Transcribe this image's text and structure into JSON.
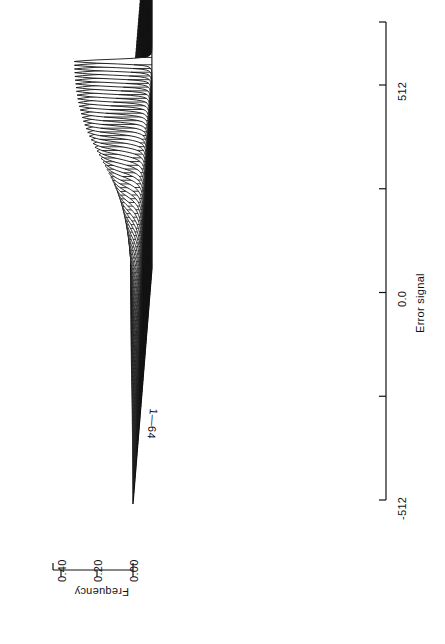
{
  "figure": {
    "orientation": "rotated-90-ccw",
    "background": "#ffffff",
    "ink": "#111111",
    "caption": ""
  },
  "axes": {
    "frequency": {
      "label": "Frequency",
      "ticks": [
        "0.00",
        "0.20",
        "0.40"
      ],
      "tick_values": [
        0.0,
        0.2,
        0.4
      ],
      "range": [
        0.0,
        0.45
      ]
    },
    "error_signal": {
      "label": "Error signal",
      "ticks": [
        "-512",
        "0.0",
        "512"
      ],
      "tick_values": [
        -512,
        0,
        512
      ],
      "range": [
        -512,
        512
      ],
      "minor_tick_count": 5
    },
    "trace": {
      "label": "1—64",
      "range": [
        1,
        64
      ]
    }
  },
  "chart_data": {
    "type": "line",
    "subtype": "ridgeline-waterfall",
    "title": "",
    "xlabel": "Error signal",
    "ylabel": "Frequency",
    "zlabel": "1—64",
    "xlim": [
      -512,
      512
    ],
    "ylim": [
      0.0,
      0.45
    ],
    "grid": false,
    "legend": false,
    "n_series": 64,
    "x": [
      -512,
      -448,
      -384,
      -320,
      -256,
      -192,
      -128,
      -96,
      -64,
      -48,
      -32,
      -24,
      -16,
      -12,
      -8,
      -6,
      -4,
      -3,
      -2,
      -1,
      0,
      1,
      2,
      3,
      4,
      6,
      8,
      12,
      16,
      24,
      32,
      48,
      64,
      96,
      128,
      192,
      256,
      320,
      384,
      448,
      512
    ],
    "series": [
      {
        "name": "1",
        "peak": 0.012,
        "width": 260
      },
      {
        "name": "2",
        "peak": 0.013,
        "width": 252
      },
      {
        "name": "3",
        "peak": 0.014,
        "width": 244
      },
      {
        "name": "4",
        "peak": 0.015,
        "width": 236
      },
      {
        "name": "5",
        "peak": 0.016,
        "width": 228
      },
      {
        "name": "6",
        "peak": 0.018,
        "width": 220
      },
      {
        "name": "7",
        "peak": 0.019,
        "width": 212
      },
      {
        "name": "8",
        "peak": 0.021,
        "width": 204
      },
      {
        "name": "9",
        "peak": 0.023,
        "width": 196
      },
      {
        "name": "10",
        "peak": 0.025,
        "width": 188
      },
      {
        "name": "11",
        "peak": 0.027,
        "width": 180
      },
      {
        "name": "12",
        "peak": 0.03,
        "width": 172
      },
      {
        "name": "13",
        "peak": 0.033,
        "width": 164
      },
      {
        "name": "14",
        "peak": 0.036,
        "width": 156
      },
      {
        "name": "15",
        "peak": 0.039,
        "width": 148
      },
      {
        "name": "16",
        "peak": 0.043,
        "width": 140
      },
      {
        "name": "17",
        "peak": 0.047,
        "width": 132
      },
      {
        "name": "18",
        "peak": 0.052,
        "width": 124
      },
      {
        "name": "19",
        "peak": 0.057,
        "width": 116
      },
      {
        "name": "20",
        "peak": 0.062,
        "width": 109
      },
      {
        "name": "21",
        "peak": 0.068,
        "width": 102
      },
      {
        "name": "22",
        "peak": 0.074,
        "width": 95
      },
      {
        "name": "23",
        "peak": 0.081,
        "width": 88
      },
      {
        "name": "24",
        "peak": 0.088,
        "width": 82
      },
      {
        "name": "25",
        "peak": 0.096,
        "width": 76
      },
      {
        "name": "26",
        "peak": 0.104,
        "width": 70
      },
      {
        "name": "27",
        "peak": 0.113,
        "width": 65
      },
      {
        "name": "28",
        "peak": 0.122,
        "width": 60
      },
      {
        "name": "29",
        "peak": 0.132,
        "width": 55
      },
      {
        "name": "30",
        "peak": 0.142,
        "width": 50
      },
      {
        "name": "31",
        "peak": 0.153,
        "width": 46
      },
      {
        "name": "32",
        "peak": 0.164,
        "width": 42
      },
      {
        "name": "33",
        "peak": 0.176,
        "width": 39
      },
      {
        "name": "34",
        "peak": 0.188,
        "width": 36
      },
      {
        "name": "35",
        "peak": 0.2,
        "width": 33
      },
      {
        "name": "36",
        "peak": 0.213,
        "width": 30
      },
      {
        "name": "37",
        "peak": 0.226,
        "width": 28
      },
      {
        "name": "38",
        "peak": 0.239,
        "width": 26
      },
      {
        "name": "39",
        "peak": 0.252,
        "width": 24
      },
      {
        "name": "40",
        "peak": 0.265,
        "width": 22
      },
      {
        "name": "41",
        "peak": 0.278,
        "width": 20
      },
      {
        "name": "42",
        "peak": 0.29,
        "width": 18.5
      },
      {
        "name": "43",
        "peak": 0.302,
        "width": 17
      },
      {
        "name": "44",
        "peak": 0.314,
        "width": 16
      },
      {
        "name": "45",
        "peak": 0.325,
        "width": 15
      },
      {
        "name": "46",
        "peak": 0.335,
        "width": 14
      },
      {
        "name": "47",
        "peak": 0.345,
        "width": 13
      },
      {
        "name": "48",
        "peak": 0.354,
        "width": 12.2
      },
      {
        "name": "49",
        "peak": 0.362,
        "width": 11.5
      },
      {
        "name": "50",
        "peak": 0.37,
        "width": 10.8
      },
      {
        "name": "51",
        "peak": 0.377,
        "width": 10.2
      },
      {
        "name": "52",
        "peak": 0.384,
        "width": 9.6
      },
      {
        "name": "53",
        "peak": 0.39,
        "width": 9.1
      },
      {
        "name": "54",
        "peak": 0.396,
        "width": 8.6
      },
      {
        "name": "55",
        "peak": 0.401,
        "width": 8.2
      },
      {
        "name": "56",
        "peak": 0.406,
        "width": 7.8
      },
      {
        "name": "57",
        "peak": 0.41,
        "width": 7.5
      },
      {
        "name": "58",
        "peak": 0.414,
        "width": 7.2
      },
      {
        "name": "59",
        "peak": 0.418,
        "width": 6.9
      },
      {
        "name": "60",
        "peak": 0.421,
        "width": 6.7
      },
      {
        "name": "61",
        "peak": 0.424,
        "width": 6.5
      },
      {
        "name": "62",
        "peak": 0.427,
        "width": 6.3
      },
      {
        "name": "63",
        "peak": 0.429,
        "width": 6.1
      },
      {
        "name": "64",
        "peak": 0.431,
        "width": 6.0
      }
    ]
  }
}
